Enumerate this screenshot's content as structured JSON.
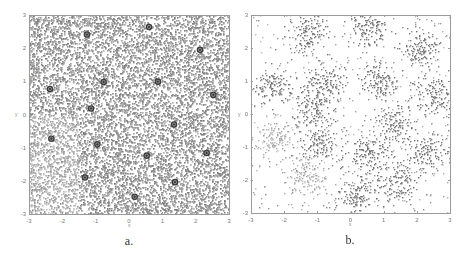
{
  "figure": {
    "panels": [
      {
        "id": "a",
        "caption": "a.",
        "xlabel": "x",
        "ylabel": "y",
        "xticks": [
          "-3",
          "-2",
          "-1",
          "0",
          "1",
          "2",
          "3"
        ],
        "yticks": [
          "3",
          "2",
          "1",
          "0",
          "-1",
          "-2",
          "-3"
        ]
      },
      {
        "id": "b",
        "caption": "b.",
        "xlabel": "x",
        "ylabel": "y",
        "xticks": [
          "-3",
          "-2",
          "-1",
          "0",
          "1",
          "2",
          "3"
        ],
        "yticks": [
          "3",
          "2",
          "1",
          "0",
          "-1",
          "-2",
          "-3"
        ]
      }
    ]
  },
  "colors": {
    "points_a": "#8c8c8c",
    "points_b": "#7d7d7d",
    "centroid": "#3a3a3a",
    "axis": "#9a9a9a"
  },
  "chart_data": [
    {
      "type": "scatter",
      "title": "",
      "caption": "a.",
      "xlabel": "x",
      "ylabel": "y",
      "xlim": [
        -3,
        3
      ],
      "ylim": [
        -3,
        3
      ],
      "grid": false,
      "description": "Dense uniformly distributed points over [-3,3]x[-3,3] with 16 circled centroid markers",
      "uniform_point_count": 9000,
      "centroids": {
        "x": [
          -1.26,
          0.6,
          2.13,
          -2.37,
          -0.76,
          0.87,
          2.53,
          -1.14,
          1.35,
          -2.33,
          -0.95,
          0.53,
          2.33,
          -1.32,
          1.38,
          0.17
        ],
        "y": [
          2.41,
          2.64,
          1.95,
          0.77,
          0.98,
          0.99,
          0.59,
          0.18,
          -0.3,
          -0.73,
          -0.9,
          -1.24,
          -1.16,
          -1.9,
          -2.04,
          -2.48
        ]
      }
    },
    {
      "type": "scatter",
      "title": "",
      "caption": "b.",
      "xlabel": "x",
      "ylabel": "y",
      "xlim": [
        -3,
        3
      ],
      "ylim": [
        -3,
        3
      ],
      "grid": false,
      "description": "Sparser points clustered around the same 16 centers plus uniform background",
      "clustered_point_count": 2200,
      "background_point_count": 500,
      "cluster_std": 0.3,
      "cluster_centers": {
        "x": [
          -1.26,
          0.6,
          2.13,
          -2.37,
          -0.76,
          0.87,
          2.53,
          -1.14,
          1.35,
          -2.33,
          -0.95,
          0.53,
          2.33,
          -1.32,
          1.38,
          0.17
        ],
        "y": [
          2.41,
          2.64,
          1.95,
          0.77,
          0.98,
          0.99,
          0.59,
          0.18,
          -0.3,
          -0.73,
          -0.9,
          -1.24,
          -1.16,
          -1.9,
          -2.04,
          -2.48
        ]
      }
    }
  ]
}
